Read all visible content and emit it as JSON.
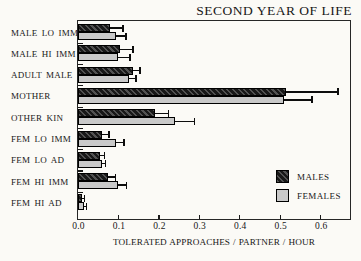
{
  "chart_data": {
    "type": "bar",
    "orientation": "horizontal",
    "title": "SECOND YEAR OF LIFE",
    "xlabel": "TOLERATED APPROACHES / PARTNER / HOUR",
    "categories": [
      "MALE LO IMM",
      "MALE HI IMM",
      "ADULT MALE",
      "MOTHER",
      "OTHER KIN",
      "FEM LO IMM",
      "FEM LO AD",
      "FEM HI IMM",
      "FEM HI AD"
    ],
    "series": [
      {
        "name": "MALES",
        "values": [
          0.08,
          0.105,
          0.135,
          0.515,
          0.19,
          0.06,
          0.055,
          0.075,
          0.01
        ],
        "errors": [
          0.033,
          0.033,
          0.02,
          0.13,
          0.035,
          0.018,
          0.012,
          0.02,
          0.008
        ],
        "style": "dark-diagonal-hatch",
        "color": "#181818"
      },
      {
        "name": "FEMALES",
        "values": [
          0.095,
          0.1,
          0.125,
          0.51,
          0.24,
          0.095,
          0.06,
          0.1,
          0.015
        ],
        "errors": [
          0.025,
          0.03,
          0.02,
          0.07,
          0.05,
          0.02,
          0.01,
          0.022,
          0.008
        ],
        "style": "solid",
        "color": "#c9c9c9"
      }
    ],
    "error_bars": "upper-only, right-pointing with end caps",
    "x_ticks": [
      "0.0",
      "0.1",
      "0.2",
      "0.3",
      "0.4",
      "0.5",
      "0.6"
    ],
    "xlim": [
      0,
      0.67
    ],
    "grid": "off",
    "legend": {
      "position": "inside lower-right",
      "entries": [
        "MALES",
        "FEMALES"
      ]
    }
  },
  "colors": {
    "background": "#fbfaf6",
    "frame": "#262626",
    "males_bar": "#181818",
    "males_hatch_line": "#525252",
    "females_bar": "#c9c9c9",
    "error_bar": "#0d0d0d",
    "text": "#171717"
  }
}
